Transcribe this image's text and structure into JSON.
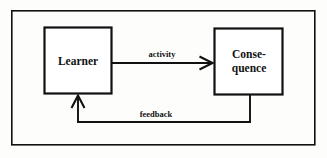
{
  "diagram": {
    "title_text": "",
    "background_color": "#fdfdfc",
    "stroke_color": "#111111",
    "frame": {
      "name": "outer-border",
      "x": 11,
      "y": 10,
      "width": 304,
      "height": 135
    },
    "nodes": [
      {
        "id": "learner",
        "label": "Learner",
        "lines": [
          "Learner"
        ],
        "x": 44,
        "y": 27,
        "width": 68,
        "height": 67
      },
      {
        "id": "consequence",
        "label": "Conse-quence",
        "lines": [
          "Conse-",
          "quence"
        ],
        "x": 214,
        "y": 28,
        "width": 69,
        "height": 67
      }
    ],
    "edges": [
      {
        "id": "activity",
        "label": "activity",
        "from": "learner",
        "to": "consequence",
        "direction": "right",
        "label_x": 162,
        "label_y": 55
      },
      {
        "id": "feedback",
        "label": "feedback",
        "from": "consequence",
        "to": "learner",
        "direction": "up",
        "label_x": 156,
        "label_y": 115
      }
    ]
  }
}
